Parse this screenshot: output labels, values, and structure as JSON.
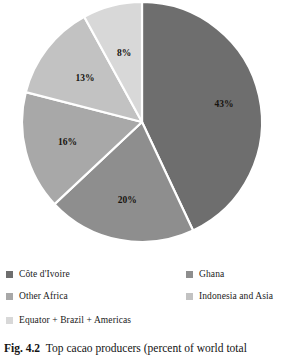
{
  "figure": {
    "caption_number": "Fig. 4.2",
    "caption_text": "Top cacao producers (percent of world total"
  },
  "chart_data": {
    "type": "pie",
    "title": "Top cacao producers (percent of world total",
    "xlabel": "",
    "ylabel": "",
    "units": "percent of world total",
    "start_angle_deg": 0,
    "direction": "clockwise",
    "legend_position": "bottom",
    "grid": false,
    "categories": [
      "Côte d'Ivoire",
      "Ghana",
      "Other Africa",
      "Indonesia and Asia",
      "Equator + Brazil + Americas"
    ],
    "values": [
      43,
      20,
      16,
      13,
      8
    ],
    "data_labels": [
      "43%",
      "20%",
      "16%",
      "13%",
      "8%"
    ],
    "colors": [
      "#6e6e6e",
      "#8e8e8e",
      "#a8a8a8",
      "#c2c2c2",
      "#d8d8d8"
    ],
    "slices": [
      {
        "label": "Côte d'Ivoire",
        "value": 43,
        "data_label": "43%",
        "color": "#6e6e6e"
      },
      {
        "label": "Ghana",
        "value": 20,
        "data_label": "20%",
        "color": "#8e8e8e"
      },
      {
        "label": "Other Africa",
        "value": 16,
        "data_label": "16%",
        "color": "#a8a8a8"
      },
      {
        "label": "Indonesia and Asia",
        "value": 13,
        "data_label": "13%",
        "color": "#c2c2c2"
      },
      {
        "label": "Equator + Brazil + Americas",
        "value": 8,
        "data_label": "8%",
        "color": "#d8d8d8"
      }
    ],
    "slice_separator_color": "#ffffff"
  },
  "legend": {
    "rows": [
      {
        "left": {
          "label": "Côte d'Ivoire",
          "color": "#6e6e6e"
        },
        "right": {
          "label": "Ghana",
          "color": "#8e8e8e"
        }
      },
      {
        "left": {
          "label": "Other Africa",
          "color": "#a8a8a8"
        },
        "right": {
          "label": "Indonesia and Asia",
          "color": "#c2c2c2"
        }
      },
      {
        "left": {
          "label": "Equator + Brazil + Americas",
          "color": "#d8d8d8"
        },
        "right": null
      }
    ]
  }
}
